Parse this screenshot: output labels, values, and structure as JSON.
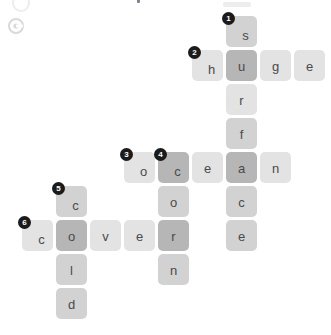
{
  "app": {
    "title": "Crossword Puzzle Grid",
    "hint_icon": "info-circle-icon"
  },
  "grid": {
    "cell_size": 31,
    "pitch": 34,
    "origin_x": 22,
    "origin_y": 16,
    "colors": {
      "tile_light": "#e3e3e3",
      "tile_mid": "#d2d2d2",
      "tile_dark": "#b6b6b6",
      "letter": "#4a4a4a",
      "clue_number_bg": "#1b1b1b",
      "clue_number_text": "#ffffff",
      "page_background": "#ffffff"
    }
  },
  "words": [
    {
      "number": "1",
      "direction": "down",
      "answer": "surface",
      "col": 6,
      "row": 0
    },
    {
      "number": "2",
      "direction": "across",
      "answer": "huge",
      "col": 5,
      "row": 1
    },
    {
      "number": "3",
      "direction": "across",
      "answer": "ocean",
      "col": 3,
      "row": 4
    },
    {
      "number": "4",
      "direction": "down",
      "answer": "corn",
      "col": 4,
      "row": 4
    },
    {
      "number": "5",
      "direction": "down",
      "answer": "cold",
      "col": 1,
      "row": 5
    },
    {
      "number": "6",
      "direction": "across",
      "answer": "cover",
      "col": 0,
      "row": 6
    }
  ],
  "cells": [
    {
      "id": "c6r0",
      "letter": "s",
      "col": 6,
      "row": 0,
      "number": "1",
      "shade": "mid"
    },
    {
      "id": "c5r1",
      "letter": "h",
      "col": 5,
      "row": 1,
      "number": "2",
      "shade": "light"
    },
    {
      "id": "c6r1",
      "letter": "u",
      "col": 6,
      "row": 1,
      "number": "",
      "shade": "dark"
    },
    {
      "id": "c7r1",
      "letter": "g",
      "col": 7,
      "row": 1,
      "number": "",
      "shade": "light"
    },
    {
      "id": "c8r1",
      "letter": "e",
      "col": 8,
      "row": 1,
      "number": "",
      "shade": "light"
    },
    {
      "id": "c6r2",
      "letter": "r",
      "col": 6,
      "row": 2,
      "number": "",
      "shade": "light"
    },
    {
      "id": "c6r3",
      "letter": "f",
      "col": 6,
      "row": 3,
      "number": "",
      "shade": "mid"
    },
    {
      "id": "c3r4",
      "letter": "o",
      "col": 3,
      "row": 4,
      "number": "3",
      "shade": "light"
    },
    {
      "id": "c4r4",
      "letter": "c",
      "col": 4,
      "row": 4,
      "number": "4",
      "shade": "dark"
    },
    {
      "id": "c5r4",
      "letter": "e",
      "col": 5,
      "row": 4,
      "number": "",
      "shade": "light"
    },
    {
      "id": "c6r4",
      "letter": "a",
      "col": 6,
      "row": 4,
      "number": "",
      "shade": "dark"
    },
    {
      "id": "c7r4",
      "letter": "n",
      "col": 7,
      "row": 4,
      "number": "",
      "shade": "light"
    },
    {
      "id": "c1r5",
      "letter": "c",
      "col": 1,
      "row": 5,
      "number": "5",
      "shade": "mid"
    },
    {
      "id": "c4r5",
      "letter": "o",
      "col": 4,
      "row": 5,
      "number": "",
      "shade": "mid"
    },
    {
      "id": "c6r5",
      "letter": "c",
      "col": 6,
      "row": 5,
      "number": "",
      "shade": "mid"
    },
    {
      "id": "c0r6",
      "letter": "c",
      "col": 0,
      "row": 6,
      "number": "6",
      "shade": "light"
    },
    {
      "id": "c1r6",
      "letter": "o",
      "col": 1,
      "row": 6,
      "number": "",
      "shade": "dark"
    },
    {
      "id": "c2r6",
      "letter": "v",
      "col": 2,
      "row": 6,
      "number": "",
      "shade": "light"
    },
    {
      "id": "c3r6",
      "letter": "e",
      "col": 3,
      "row": 6,
      "number": "",
      "shade": "light"
    },
    {
      "id": "c4r6",
      "letter": "r",
      "col": 4,
      "row": 6,
      "number": "",
      "shade": "dark"
    },
    {
      "id": "c6r6",
      "letter": "e",
      "col": 6,
      "row": 6,
      "number": "",
      "shade": "mid"
    },
    {
      "id": "c1r7",
      "letter": "l",
      "col": 1,
      "row": 7,
      "number": "",
      "shade": "mid"
    },
    {
      "id": "c4r7",
      "letter": "n",
      "col": 4,
      "row": 7,
      "number": "",
      "shade": "mid"
    },
    {
      "id": "c1r8",
      "letter": "d",
      "col": 1,
      "row": 8,
      "number": "",
      "shade": "mid"
    }
  ]
}
